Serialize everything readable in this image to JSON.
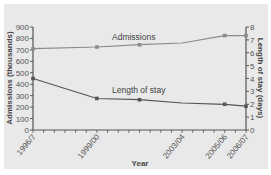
{
  "chart_data": {
    "type": "line",
    "title": "",
    "xlabel": "Year",
    "ylabel": "Admissions (thousands)",
    "y2label": "Length of stay (days)",
    "x_tick_labels": [
      "1996/7",
      "1999/00",
      "2003/04",
      "2005/06",
      "2006/07"
    ],
    "x_range": [
      1996,
      2006
    ],
    "ylim": [
      0,
      900
    ],
    "y_ticks": [
      0,
      100,
      200,
      300,
      400,
      500,
      600,
      700,
      800,
      900
    ],
    "y2lim": [
      0,
      8
    ],
    "y2_ticks": [
      0,
      1,
      2,
      3,
      4,
      5,
      6,
      7,
      8
    ],
    "grid": false,
    "legend": "inline labels",
    "series": [
      {
        "name": "Admissions",
        "axis": "left",
        "color": "#8a8a8a",
        "points": [
          {
            "x": 1996,
            "label": "1996/7",
            "y": 710,
            "marker": true
          },
          {
            "x": 1999,
            "label": "1999/00",
            "y": 725,
            "marker": true
          },
          {
            "x": 2001,
            "label": "2001/02",
            "y": 745,
            "marker": true
          },
          {
            "x": 2003,
            "label": "2003/04",
            "y": 760,
            "marker": false
          },
          {
            "x": 2005,
            "label": "2005/06",
            "y": 825,
            "marker": true
          },
          {
            "x": 2006,
            "label": "2006/07",
            "y": 825,
            "marker": true
          }
        ]
      },
      {
        "name": "Length of stay",
        "axis": "right",
        "color": "#555555",
        "points": [
          {
            "x": 1996,
            "label": "1996/7",
            "y": 4.0,
            "marker": true
          },
          {
            "x": 1999,
            "label": "1999/00",
            "y": 2.45,
            "marker": true
          },
          {
            "x": 2001,
            "label": "2001/02",
            "y": 2.35,
            "marker": true
          },
          {
            "x": 2003,
            "label": "2003/04",
            "y": 2.1,
            "marker": false
          },
          {
            "x": 2005,
            "label": "2005/06",
            "y": 2.0,
            "marker": true
          },
          {
            "x": 2006,
            "label": "2006/07",
            "y": 1.85,
            "marker": true
          }
        ]
      }
    ]
  }
}
